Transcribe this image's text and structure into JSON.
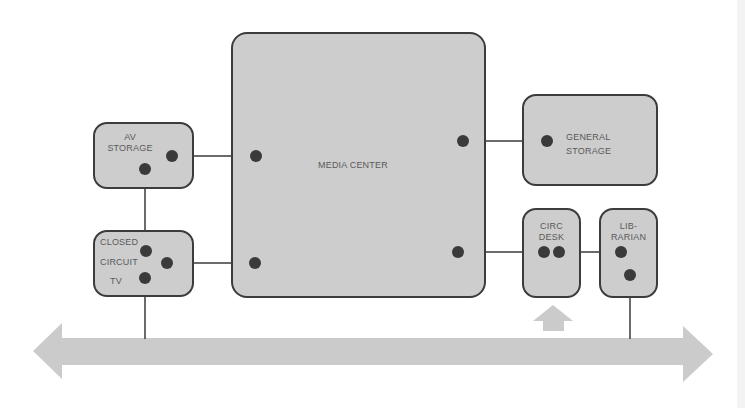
{
  "diagram": {
    "type": "space-relationship",
    "colors": {
      "room_fill": "#cdcdcd",
      "room_border": "#3c3c3c",
      "connector": "#3a3a3a",
      "arrow_fill": "#cbcbcb",
      "label_text": "#5a5a5a"
    },
    "rooms": {
      "av_storage": {
        "line1": "AV",
        "line2": "STORAGE"
      },
      "cctv": {
        "line1": "CLOSED",
        "line2": "CIRCUIT",
        "line3": "TV"
      },
      "media_center": {
        "label": "MEDIA CENTER"
      },
      "general_storage": {
        "line1": "GENERAL",
        "line2": "STORAGE"
      },
      "circ_desk": {
        "line1": "CIRC",
        "line2": "DESK"
      },
      "librarian": {
        "line1": "LIB-",
        "line2": "RARIAN"
      }
    },
    "connections": [
      {
        "from": "AV STORAGE",
        "to": "MEDIA CENTER"
      },
      {
        "from": "AV STORAGE",
        "to": "CLOSED CIRCUIT TV"
      },
      {
        "from": "CLOSED CIRCUIT TV",
        "to": "MEDIA CENTER"
      },
      {
        "from": "CLOSED CIRCUIT TV",
        "to": "CORRIDOR"
      },
      {
        "from": "MEDIA CENTER",
        "to": "GENERAL STORAGE"
      },
      {
        "from": "MEDIA CENTER",
        "to": "CIRC DESK"
      },
      {
        "from": "CIRC DESK",
        "to": "LIBRARIAN"
      },
      {
        "from": "LIBRARIAN",
        "to": "CORRIDOR"
      }
    ],
    "corridor": {
      "direction": "bidirectional",
      "entrance_arrow_target": "CIRC DESK"
    }
  }
}
